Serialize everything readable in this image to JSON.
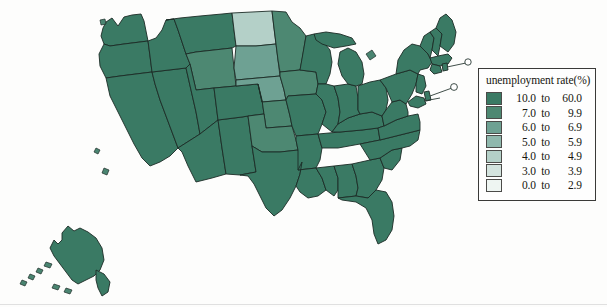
{
  "figure": {
    "type": "choropleth-map",
    "region": "United States",
    "title": "",
    "insets": [
      "Alaska"
    ]
  },
  "legend": {
    "title": "unemployment rate(%)",
    "classes": [
      {
        "color": "#3a7a64",
        "from": "10.0",
        "to_label": "to",
        "to": "60.0"
      },
      {
        "color": "#4d8872",
        "from": "7.0",
        "to_label": "to",
        "to": "9.9"
      },
      {
        "color": "#6ea193",
        "from": "6.0",
        "to_label": "to",
        "to": "6.9"
      },
      {
        "color": "#8fb8ad",
        "from": "5.0",
        "to_label": "to",
        "to": "5.9"
      },
      {
        "color": "#b4d0c8",
        "from": "4.0",
        "to_label": "to",
        "to": "4.9"
      },
      {
        "color": "#d3e3de",
        "from": "3.0",
        "to_label": "to",
        "to": "3.9"
      },
      {
        "color": "#eef5f2",
        "from": "0.0",
        "to_label": "to",
        "to": "2.9"
      }
    ]
  },
  "chart_data": {
    "type": "heatmap",
    "title": "unemployment rate(%)",
    "xlabel": "",
    "ylabel": "",
    "legend_position": "right",
    "grid": false,
    "color_scale": [
      {
        "label": "10.0 to 60.0",
        "color": "#3a7a64",
        "min": 10.0,
        "max": 60.0
      },
      {
        "label": "7.0 to 9.9",
        "color": "#4d8872",
        "min": 7.0,
        "max": 9.9
      },
      {
        "label": "6.0 to 6.9",
        "color": "#6ea193",
        "min": 6.0,
        "max": 6.9
      },
      {
        "label": "5.0 to 5.9",
        "color": "#8fb8ad",
        "min": 5.0,
        "max": 5.9
      },
      {
        "label": "4.0 to 4.9",
        "color": "#b4d0c8",
        "min": 4.0,
        "max": 4.9
      },
      {
        "label": "3.0 to 3.9",
        "color": "#d3e3de",
        "min": 3.0,
        "max": 3.9
      },
      {
        "label": "0.0 to 2.9",
        "color": "#eef5f2",
        "min": 0.0,
        "max": 2.9
      }
    ],
    "categories": [
      "WA",
      "OR",
      "CA",
      "NV",
      "ID",
      "MT",
      "WY",
      "UT",
      "AZ",
      "NM",
      "CO",
      "ND",
      "SD",
      "NE",
      "KS",
      "OK",
      "TX",
      "MN",
      "IA",
      "MO",
      "AR",
      "LA",
      "WI",
      "IL",
      "MS",
      "AL",
      "TN",
      "KY",
      "IN",
      "MI",
      "OH",
      "GA",
      "FL",
      "SC",
      "NC",
      "VA",
      "WV",
      "PA",
      "NY",
      "VT",
      "NH",
      "ME",
      "MA",
      "RI",
      "CT",
      "NJ",
      "DE",
      "MD",
      "AK"
    ],
    "values": [
      "10.0 to 60.0",
      "10.0 to 60.0",
      "10.0 to 60.0",
      "10.0 to 60.0",
      "10.0 to 60.0",
      "10.0 to 60.0",
      "7.0 to 9.9",
      "10.0 to 60.0",
      "10.0 to 60.0",
      "10.0 to 60.0",
      "10.0 to 60.0",
      "4.0 to 4.9",
      "6.0 to 6.9",
      "6.0 to 6.9",
      "7.0 to 9.9",
      "7.0 to 9.9",
      "10.0 to 60.0",
      "7.0 to 9.9",
      "7.0 to 9.9",
      "10.0 to 60.0",
      "10.0 to 60.0",
      "10.0 to 60.0",
      "10.0 to 60.0",
      "10.0 to 60.0",
      "10.0 to 60.0",
      "10.0 to 60.0",
      "10.0 to 60.0",
      "10.0 to 60.0",
      "10.0 to 60.0",
      "10.0 to 60.0",
      "10.0 to 60.0",
      "10.0 to 60.0",
      "10.0 to 60.0",
      "10.0 to 60.0",
      "10.0 to 60.0",
      "10.0 to 60.0",
      "10.0 to 60.0",
      "10.0 to 60.0",
      "10.0 to 60.0",
      "10.0 to 60.0",
      "10.0 to 60.0",
      "10.0 to 60.0",
      "10.0 to 60.0",
      "10.0 to 60.0",
      "10.0 to 60.0",
      "10.0 to 60.0",
      "10.0 to 60.0",
      "10.0 to 60.0",
      "10.0 to 60.0"
    ]
  }
}
